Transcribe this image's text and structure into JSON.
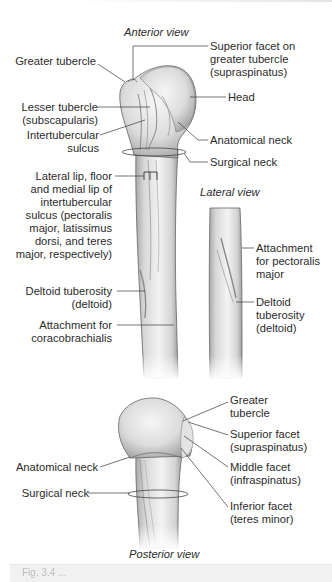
{
  "figure": {
    "views": {
      "anterior": "Anterior view",
      "lateral": "Lateral view",
      "posterior": "Posterior view"
    },
    "anterior_labels": {
      "greater_tubercle": "Greater tubercle",
      "superior_facet": "Superior facet on\ngreater tubercle\n(supraspinatus)",
      "lesser_tubercle": "Lesser tubercle\n(subscapularis)",
      "head": "Head",
      "intertubercular_sulcus": "Intertubercular\nsulcus",
      "anatomical_neck": "Anatomical neck",
      "surgical_neck": "Surgical neck",
      "lips": "Lateral lip, floor\nand medial lip of\nintertubercular\nsulcus (pectoralis\nmajor, latissimus\ndorsi, and teres\nmajor, respectively)",
      "deltoid_tuberosity": "Deltoid tuberosity\n(deltoid)",
      "coracobrachialis": "Attachment for\ncoracobrachialis"
    },
    "lateral_labels": {
      "pectoralis": "Attachment\nfor pectoralis\nmajor",
      "deltoid_tuberosity": "Deltoid\ntuberosity\n(deltoid)"
    },
    "posterior_labels": {
      "greater_tubercle": "Greater\ntubercle",
      "superior_facet": "Superior facet\n(supraspinatus)",
      "middle_facet": "Middle facet\n(infraspinatus)",
      "inferior_facet": "Inferior facet\n(teres minor)",
      "anatomical_neck": "Anatomical neck",
      "surgical_neck": "Surgical neck"
    },
    "caption": "Fig. 3.4 ..."
  },
  "colors": {
    "bone_light": "#f2f2f2",
    "bone_mid": "#d6d6d6",
    "bone_dark": "#a9a9a9",
    "outline": "#555555",
    "leader": "#3a3a3a",
    "text": "#2b2b2b"
  }
}
